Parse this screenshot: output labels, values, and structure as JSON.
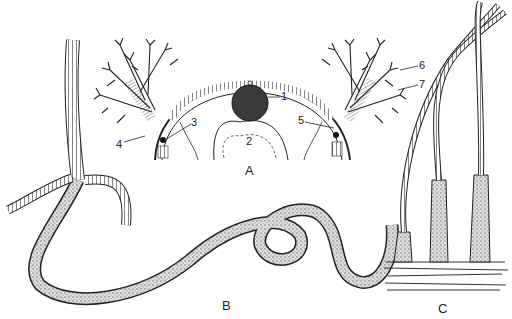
{
  "figure": {
    "panels": [
      {
        "id": "A",
        "label": "A",
        "description": "cross-section of tube worm crown with branched gills"
      },
      {
        "id": "B",
        "label": "B",
        "description": "whole segmented worm, coiled"
      },
      {
        "id": "C",
        "label": "C",
        "description": "worms emerging from tubes in sediment"
      }
    ],
    "callouts": [
      "1",
      "2",
      "3",
      "4",
      "5",
      "6",
      "7"
    ],
    "colors": {
      "ink": "#222222",
      "shade": "#555555",
      "background": "#ffffff"
    }
  }
}
